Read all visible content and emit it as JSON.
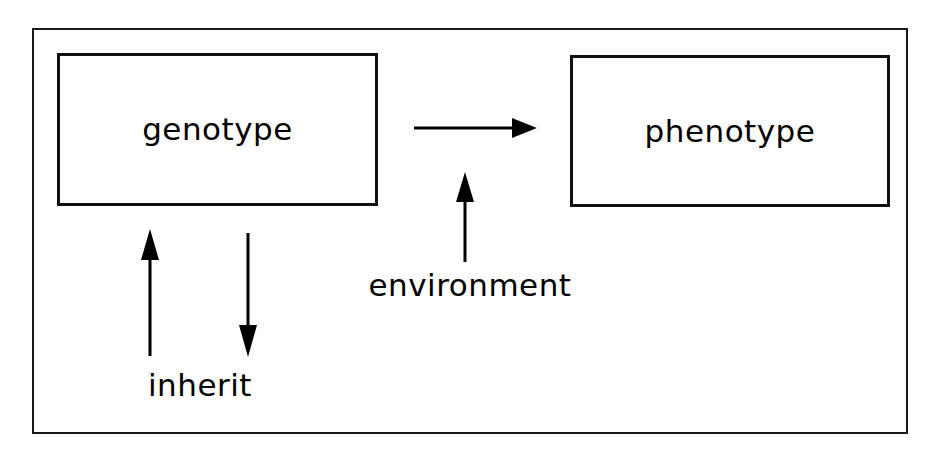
{
  "figure": {
    "type": "concept-diagram",
    "title_visible": false,
    "frame": {
      "visible": true,
      "border_color": "#1a1a1a"
    },
    "background_color": "#ffffff",
    "line_color": "#000000"
  },
  "nodes": [
    {
      "id": "genotype",
      "label": "genotype",
      "shape": "rectangle",
      "border_color": "#111111",
      "fill_color": "#ffffff"
    },
    {
      "id": "phenotype",
      "label": "phenotype",
      "shape": "rectangle",
      "border_color": "#111111",
      "fill_color": "#ffffff"
    }
  ],
  "edges": [
    {
      "id": "genotype-to-phenotype",
      "from": "genotype",
      "to": "phenotype",
      "direction": "right",
      "label": "",
      "color": "#000000"
    },
    {
      "id": "environment-influence",
      "from": "environment",
      "to": "genotype-to-phenotype",
      "direction": "up",
      "label": "environment",
      "color": "#000000"
    },
    {
      "id": "inherit-up",
      "from": "offspring",
      "to": "genotype",
      "direction": "up",
      "label": "inherit",
      "color": "#000000"
    },
    {
      "id": "inherit-down",
      "from": "genotype",
      "to": "offspring",
      "direction": "down",
      "label": "inherit",
      "color": "#000000"
    }
  ],
  "labels": {
    "environment": "environment",
    "inherit": "inherit"
  },
  "colors": {
    "stroke": "#000000",
    "frame": "#1a1a1a",
    "box_border": "#111111",
    "background": "#ffffff",
    "text": "#000000"
  }
}
